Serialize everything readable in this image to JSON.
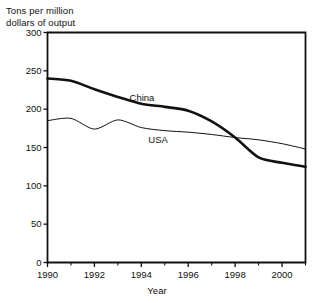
{
  "chart_data": {
    "type": "line",
    "title": "",
    "ylabel": "Tons per million\ndollars of output",
    "xlabel": "Year",
    "ylim": [
      0,
      300
    ],
    "xlim": [
      1990,
      2001
    ],
    "ytick_labels": [
      "0",
      "50",
      "100",
      "150",
      "200",
      "250",
      "300"
    ],
    "ytick_values": [
      0,
      50,
      100,
      150,
      200,
      250,
      300
    ],
    "xtick_labels": [
      "1990",
      "1992",
      "1994",
      "1996",
      "1998",
      "2000"
    ],
    "xtick_values": [
      1990,
      1992,
      1994,
      1996,
      1998,
      2000
    ],
    "xtick_minor_values": [
      1991,
      1993,
      1995,
      1997,
      1999,
      2001
    ],
    "grid": false,
    "legend_position": "inline-labels",
    "x": [
      1990,
      1991,
      1992,
      1993,
      1994,
      1995,
      1996,
      1997,
      1998,
      1999,
      2000,
      2001
    ],
    "series": [
      {
        "name": "China",
        "label": "China",
        "color": "#111111",
        "line_width": 2.6,
        "values": [
          240,
          237,
          226,
          216,
          207,
          203,
          198,
          184,
          163,
          137,
          130,
          125
        ],
        "label_x": 1993.5,
        "label_y": 215
      },
      {
        "name": "USA",
        "label": "USA",
        "color": "#111111",
        "line_width": 1.0,
        "values": [
          185,
          188,
          174,
          186,
          176,
          172,
          170,
          167,
          163,
          160,
          155,
          148
        ],
        "label_x": 1994.3,
        "label_y": 160
      }
    ]
  },
  "axes": {
    "frame_color": "#111111",
    "frame_width": 1.8,
    "background": "#ffffff"
  }
}
